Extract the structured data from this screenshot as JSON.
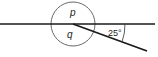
{
  "diagram": {
    "title": "",
    "labels": {
      "p": "p",
      "q": "q",
      "angle": "25°"
    },
    "colors": {
      "line": "#1a1a1a",
      "background": "#ffffff"
    },
    "geometry": {
      "horizontal_line": {
        "x1": 0,
        "y1": 24,
        "x2": 155,
        "y2": 24
      },
      "circle": {
        "cx": 73,
        "cy": 24,
        "r": 22
      },
      "slanted_line": {
        "x1": 73,
        "y1": 24,
        "x2": 147,
        "y2": 51
      },
      "angle_arc_radius": 52,
      "angle_degrees": 25
    }
  }
}
